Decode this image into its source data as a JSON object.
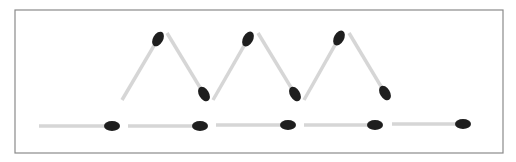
{
  "puzzle": {
    "title": "Matchstick puzzle",
    "frame": {
      "x": 15,
      "y": 10,
      "w": 488,
      "h": 143,
      "stroke": "#8a8a8a"
    },
    "colors": {
      "stick": "#d6d6d6",
      "head": "#1e1e1e",
      "background": "#ffffff"
    },
    "zigzag_matches": [
      {
        "x1": 122,
        "y1": 100,
        "x2": 158,
        "y2": 39
      },
      {
        "x1": 167,
        "y1": 33,
        "x2": 204,
        "y2": 94
      },
      {
        "x1": 213,
        "y1": 100,
        "x2": 248,
        "y2": 39
      },
      {
        "x1": 258,
        "y1": 33,
        "x2": 295,
        "y2": 94
      },
      {
        "x1": 304,
        "y1": 100,
        "x2": 339,
        "y2": 38
      },
      {
        "x1": 349,
        "y1": 33,
        "x2": 385,
        "y2": 93
      }
    ],
    "horizontal_matches": [
      {
        "x1": 39,
        "y1": 126,
        "x2": 112,
        "y2": 126
      },
      {
        "x1": 128,
        "y1": 126,
        "x2": 200,
        "y2": 126
      },
      {
        "x1": 216,
        "y1": 125,
        "x2": 288,
        "y2": 125
      },
      {
        "x1": 304,
        "y1": 125,
        "x2": 375,
        "y2": 125
      },
      {
        "x1": 392,
        "y1": 124,
        "x2": 463,
        "y2": 124
      }
    ]
  }
}
